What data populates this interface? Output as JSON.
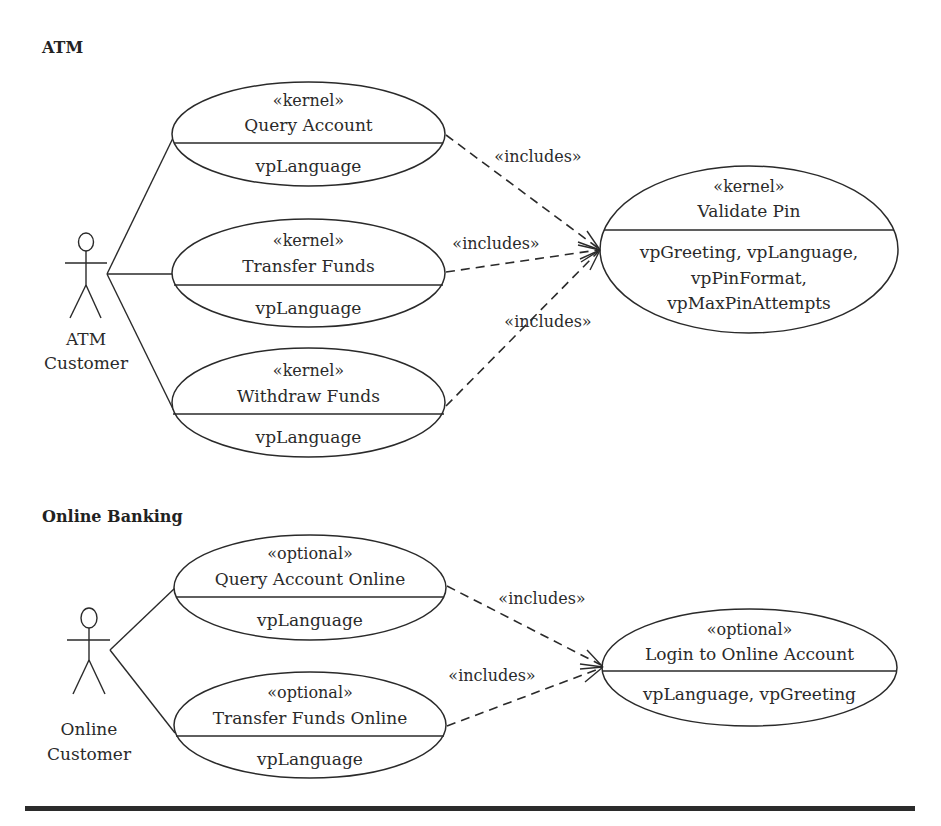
{
  "sections": [
    {
      "title": "ATM",
      "actor": {
        "label_line1": "ATM",
        "label_line2": "Customer"
      },
      "use_cases": [
        {
          "stereotype": "«kernel»",
          "name": "Query Account",
          "variation_points": [
            "vpLanguage"
          ]
        },
        {
          "stereotype": "«kernel»",
          "name": "Transfer Funds",
          "variation_points": [
            "vpLanguage"
          ]
        },
        {
          "stereotype": "«kernel»",
          "name": "Withdraw Funds",
          "variation_points": [
            "vpLanguage"
          ]
        }
      ],
      "included_use_case": {
        "stereotype": "«kernel»",
        "name": "Validate Pin",
        "variation_point_lines": [
          "vpGreeting, vpLanguage,",
          "vpPinFormat,",
          "vpMaxPinAttempts"
        ]
      },
      "relationships": [
        {
          "from": "Query Account",
          "to": "Validate Pin",
          "label": "«includes»"
        },
        {
          "from": "Transfer Funds",
          "to": "Validate Pin",
          "label": "«includes»"
        },
        {
          "from": "Withdraw Funds",
          "to": "Validate Pin",
          "label": "«includes»"
        }
      ]
    },
    {
      "title": "Online Banking",
      "actor": {
        "label_line1": "Online",
        "label_line2": "Customer"
      },
      "use_cases": [
        {
          "stereotype": "«optional»",
          "name": "Query Account Online",
          "variation_points": [
            "vpLanguage"
          ]
        },
        {
          "stereotype": "«optional»",
          "name": "Transfer Funds Online",
          "variation_points": [
            "vpLanguage"
          ]
        }
      ],
      "included_use_case": {
        "stereotype": "«optional»",
        "name": "Login to Online Account",
        "variation_point_lines": [
          "vpLanguage, vpGreeting"
        ]
      },
      "relationships": [
        {
          "from": "Query Account Online",
          "to": "Login to Online Account",
          "label": "«includes»"
        },
        {
          "from": "Transfer Funds Online",
          "to": "Login to Online Account",
          "label": "«includes»"
        }
      ]
    }
  ],
  "colors": {
    "ink": "#2a2a2a",
    "background": "#ffffff"
  }
}
